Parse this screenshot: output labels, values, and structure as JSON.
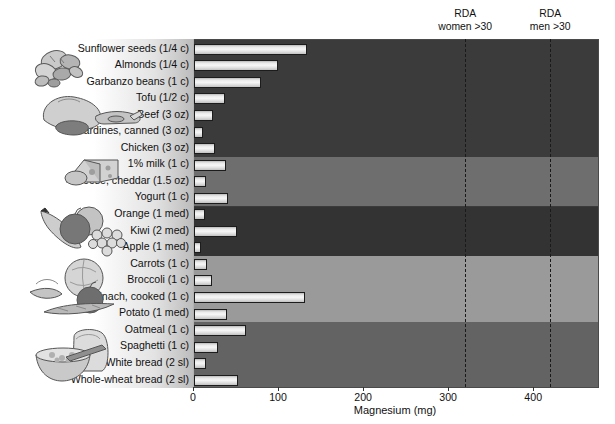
{
  "chart_data": {
    "type": "bar",
    "orientation": "horizontal",
    "title": "",
    "xlabel": "Magnesium (mg)",
    "ylabel": "",
    "xlim": [
      0,
      475
    ],
    "xticks": [
      0,
      100,
      200,
      300,
      400
    ],
    "xticklabels": [
      "0",
      "100",
      "200",
      "300",
      "400"
    ],
    "grid": false,
    "legend": "none",
    "categories": [
      "Sunflower seeds (1/4 c)",
      "Almonds  (1/4 c)",
      "Garbanzo beans (1 c)",
      "Tofu (1/2 c)",
      "Beef (3 oz)",
      "Sardines, canned (3 oz)",
      "Chicken (3 oz)",
      "1% milk (1 c)",
      "Cheese, cheddar (1.5 oz)",
      "Yogurt (1 c)",
      "Orange (1 med)",
      "Kiwi (2 med)",
      "Apple (1 med)",
      "Carrots (1 c)",
      "Broccoli (1 c)",
      "Spinach, cooked (1 c)",
      "Potato (1 med)",
      "Oatmeal (1 c)",
      "Spaghetti (1 c)",
      "White bread (2 sl)",
      "Whole-wheat bread (2 sl)"
    ],
    "values": [
      133,
      99,
      79,
      37,
      22,
      10,
      25,
      38,
      14,
      40,
      13,
      50,
      8,
      15,
      21,
      130,
      39,
      61,
      28,
      14,
      52
    ],
    "annotations": [
      {
        "label_line1": "RDA",
        "label_line2": "women >30",
        "value": 320
      },
      {
        "label_line1": "RDA",
        "label_line2": "men >30",
        "value": 420
      }
    ],
    "groups": [
      {
        "name": "protein-foods",
        "icon": "nuts-poultry-icon",
        "rows": 7,
        "band_color": "#3b3b3b"
      },
      {
        "name": "dairy",
        "icon": "cheese-icon",
        "rows": 3,
        "band_color": "#6e6e6e"
      },
      {
        "name": "fruits",
        "icon": "fruit-icon",
        "rows": 3,
        "band_color": "#333333"
      },
      {
        "name": "vegetables",
        "icon": "vegetables-icon",
        "rows": 4,
        "band_color": "#9a9a9a"
      },
      {
        "name": "grains",
        "icon": "bread-cereal-icon",
        "rows": 4,
        "band_color": "#636363"
      }
    ]
  },
  "axis": {
    "x_title": "Magnesium (mg)",
    "ticks": [
      "0",
      "100",
      "200",
      "300",
      "400"
    ]
  },
  "rda": [
    {
      "line1": "RDA",
      "line2": "women >30"
    },
    {
      "line1": "RDA",
      "line2": "men >30"
    }
  ]
}
